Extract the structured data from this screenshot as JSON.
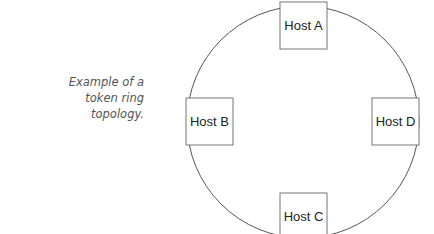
{
  "caption": {
    "line1": "Example of a",
    "line2": "token ring",
    "line3": "topology."
  },
  "diagram": {
    "type": "token-ring-topology",
    "ring_color": "#555555",
    "box_border_color": "#777777",
    "hosts": [
      {
        "label": "Host A",
        "position": "top"
      },
      {
        "label": "Host B",
        "position": "left"
      },
      {
        "label": "Host C",
        "position": "bottom"
      },
      {
        "label": "Host D",
        "position": "right"
      }
    ]
  }
}
